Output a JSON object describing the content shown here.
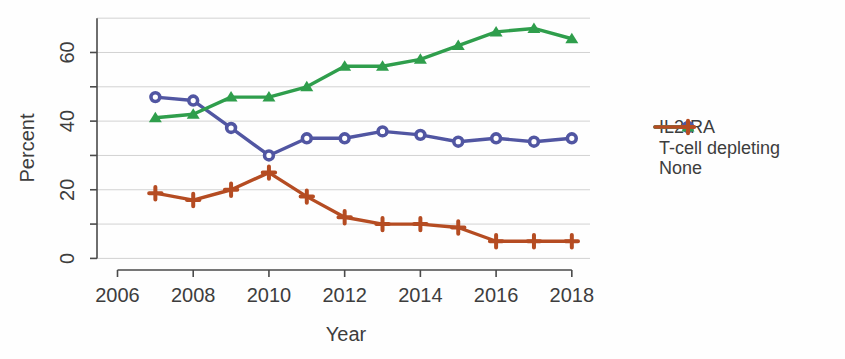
{
  "figure": {
    "background": "#fefefe",
    "text_color": "#3d3d3d",
    "axis_color": "#4a4a4a",
    "grid_color": "#d2d2d2"
  },
  "chart_data": {
    "type": "line",
    "title": "",
    "xlabel": "Year",
    "ylabel": "Percent",
    "grid": true,
    "legend_position": "right",
    "xlim": [
      2006,
      2018
    ],
    "ylim": [
      0,
      70
    ],
    "xticks": [
      2006,
      2008,
      2010,
      2012,
      2014,
      2016,
      2018
    ],
    "yticks_labeled": [
      0,
      20,
      40,
      60
    ],
    "yticks_minor": [
      0,
      10,
      20,
      30,
      40,
      50,
      60
    ],
    "gridline_values": [
      0,
      10,
      20,
      30,
      40,
      50,
      60,
      70
    ],
    "x": [
      2007,
      2008,
      2009,
      2010,
      2011,
      2012,
      2013,
      2014,
      2015,
      2016,
      2017,
      2018
    ],
    "series": [
      {
        "name": "IL2-RA",
        "marker": "circle-open",
        "color": "#5156a2",
        "values": [
          47,
          46,
          38,
          30,
          35,
          35,
          37,
          36,
          34,
          35,
          34,
          35
        ]
      },
      {
        "name": "T-cell depleting",
        "marker": "triangle",
        "color": "#2f9e4c",
        "values": [
          41,
          42,
          47,
          47,
          50,
          56,
          56,
          58,
          62,
          66,
          67,
          64
        ]
      },
      {
        "name": "None",
        "marker": "plus",
        "color": "#b54c22",
        "values": [
          19,
          17,
          20,
          25,
          18,
          12,
          10,
          10,
          9,
          5,
          5,
          5
        ]
      }
    ]
  }
}
